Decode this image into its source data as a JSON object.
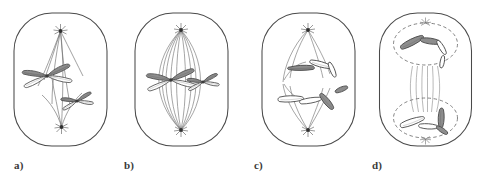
{
  "figure": {
    "background_color": "#ffffff",
    "outline_color": "#4a4a4a",
    "fiber_color": "#6e6e6e",
    "chromatid_dark_fill": "#8d8d8d",
    "chromatid_light_fill": "#ffffff",
    "chromatid_stroke": "#4a4a4a",
    "label_color": "#3a3a3a",
    "panel_count": 4
  },
  "panels": [
    {
      "id": "panel-a",
      "label": "a)",
      "stage_name": "prophase",
      "cell_shape": "rounded-rectangle",
      "spindle_poles": 2,
      "chromosome_count": 2,
      "chromosome_shape": "x-shaped",
      "nuclear_envelope": "absent",
      "aster_rays": 9,
      "spindle_fibers": 5,
      "chromosomes": [
        {
          "name": "chromosome-large",
          "form": "x-shaped",
          "position": "upper-left"
        },
        {
          "name": "chromosome-small",
          "form": "x-shaped",
          "position": "lower-right"
        }
      ]
    },
    {
      "id": "panel-b",
      "label": "b)",
      "stage_name": "metaphase",
      "cell_shape": "rounded-rectangle",
      "spindle_poles": 2,
      "chromosome_count": 2,
      "chromosome_shape": "x-shaped",
      "nuclear_envelope": "absent",
      "aster_rays": 9,
      "spindle_fibers": 12,
      "chromosomes": [
        {
          "name": "chromosome-large",
          "form": "x-shaped",
          "position": "equator-left"
        },
        {
          "name": "chromosome-small",
          "form": "x-shaped",
          "position": "equator-right"
        }
      ]
    },
    {
      "id": "panel-c",
      "label": "c)",
      "stage_name": "anaphase",
      "cell_shape": "rounded-rectangle",
      "spindle_poles": 2,
      "chromosome_count": 4,
      "chromosome_shape": "v-shaped",
      "nuclear_envelope": "absent",
      "aster_rays": 9,
      "spindle_fibers": 8,
      "chromosomes": [
        {
          "name": "chromatid-upper-dark",
          "form": "v-shaped",
          "position": "upper-left"
        },
        {
          "name": "chromatid-upper-light",
          "form": "v-shaped",
          "position": "upper-right"
        },
        {
          "name": "chromatid-lower-light",
          "form": "v-shaped",
          "position": "lower-left"
        },
        {
          "name": "chromatid-lower-dark",
          "form": "v-shaped",
          "position": "lower-right"
        }
      ]
    },
    {
      "id": "panel-d",
      "label": "d)",
      "stage_name": "telophase",
      "cell_shape": "rounded-rectangle",
      "spindle_poles": 2,
      "chromosome_count": 4,
      "chromosome_shape": "v-shaped",
      "nuclear_envelope": "reforming-dashed",
      "aster_rays": 7,
      "spindle_fibers": 6,
      "midbody_fibers": 6,
      "chromosomes": [
        {
          "name": "chromatid-upper-dark",
          "form": "v-shaped",
          "position": "upper-nucleus-left"
        },
        {
          "name": "chromatid-upper-light",
          "form": "v-shaped",
          "position": "upper-nucleus-right"
        },
        {
          "name": "chromatid-lower-light",
          "form": "v-shaped",
          "position": "lower-nucleus-left"
        },
        {
          "name": "chromatid-lower-dark",
          "form": "v-shaped",
          "position": "lower-nucleus-right"
        }
      ]
    }
  ],
  "layout": {
    "panel_x": [
      0,
      121,
      248,
      365
    ],
    "label_x": [
      14,
      124,
      254,
      372
    ],
    "label_y": 160
  }
}
